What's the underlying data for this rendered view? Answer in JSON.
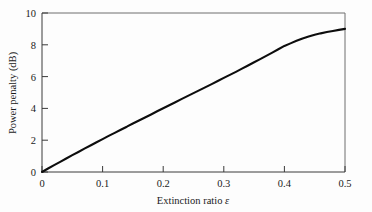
{
  "chart_data": {
    "type": "line",
    "title": "",
    "subtitle": "",
    "xlabel_prefix": "Extinction ratio ",
    "xlabel_symbol": "ε",
    "xlabel": "Extinction ratio ε",
    "ylabel": "Power penalty (dB)",
    "xlim": [
      0,
      0.5
    ],
    "ylim": [
      0,
      10
    ],
    "xticks": [
      0,
      0.1,
      0.2,
      0.3,
      0.4,
      0.5
    ],
    "xtick_labels": [
      "0",
      "0.1",
      "0.2",
      "0.3",
      "0.4",
      "0.5"
    ],
    "yticks": [
      0,
      2,
      4,
      6,
      8,
      10
    ],
    "ytick_labels": [
      "0",
      "2",
      "4",
      "6",
      "8",
      "10"
    ],
    "grid": false,
    "legend": null,
    "legend_position": "none",
    "tick_direction": "in",
    "curve_color": "#0d0d0d",
    "frame_color": "#6e6e6e",
    "background_color": "#fdfdfd",
    "series": [
      {
        "name": "Power penalty",
        "x": [
          0.0,
          0.01,
          0.02,
          0.03,
          0.04,
          0.05,
          0.06,
          0.07,
          0.08,
          0.09,
          0.1,
          0.11,
          0.12,
          0.13,
          0.14,
          0.15,
          0.16,
          0.17,
          0.18,
          0.19,
          0.2,
          0.21,
          0.22,
          0.23,
          0.24,
          0.25,
          0.26,
          0.27,
          0.28,
          0.29,
          0.3,
          0.31,
          0.32,
          0.33,
          0.34,
          0.35,
          0.36,
          0.37,
          0.38,
          0.39,
          0.4,
          0.41,
          0.42,
          0.43,
          0.44,
          0.45,
          0.46,
          0.47,
          0.48,
          0.49,
          0.5
        ],
        "y": [
          0.0,
          0.22,
          0.43,
          0.64,
          0.85,
          1.06,
          1.26,
          1.47,
          1.67,
          1.87,
          2.07,
          2.27,
          2.46,
          2.66,
          2.85,
          3.05,
          3.24,
          3.43,
          3.62,
          3.82,
          4.01,
          4.2,
          4.39,
          4.58,
          4.77,
          4.96,
          5.15,
          5.34,
          5.53,
          5.72,
          5.92,
          6.11,
          6.3,
          6.5,
          6.7,
          6.9,
          7.1,
          7.3,
          7.51,
          7.72,
          7.93,
          8.09,
          8.25,
          8.4,
          8.52,
          8.63,
          8.72,
          8.8,
          8.87,
          8.94,
          9.0
        ]
      }
    ],
    "annotations": []
  }
}
